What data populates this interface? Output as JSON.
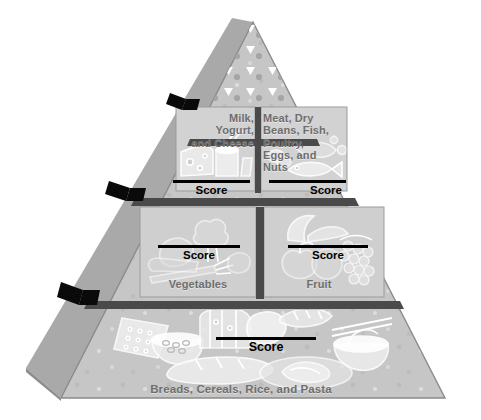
{
  "figure": {
    "background_color": "#ffffff",
    "face_color": "#c6c6c6",
    "side_face_color": "#a9a9a9",
    "panel_color": "#cfcfcf",
    "divider_color": "#3c3c3c",
    "tick_color": "#111111",
    "label_color": "#6e6e6e",
    "score_color": "#000000",
    "art_color": "#ffffff"
  },
  "apex": {
    "name": "fats-oils-and-sweets-tier",
    "symbol_triangle": "▽",
    "symbol_circle": "●",
    "triangle_count": 22,
    "circle_count": 17
  },
  "tiers": [
    {
      "id": "tier-apex",
      "level": 1,
      "panels": []
    },
    {
      "id": "tier-upper",
      "level": 2,
      "panels": [
        {
          "id": "milk-yogurt-cheese",
          "label": "Milk,\nYogurt,\nand Cheese",
          "label_lines": [
            "Milk,",
            "Yogurt,",
            "and Cheese"
          ],
          "score_label": "Score",
          "score_value": ""
        },
        {
          "id": "meat-beans-fish-poultry-eggs-nuts",
          "label": "Meat, Dry Beans, Fish, Poultry, Eggs, and Nuts",
          "label_lines": [
            "Meat, Dry",
            "Beans, Fish,",
            "Poultry,",
            "Eggs, and",
            "Nuts"
          ],
          "score_label": "Score",
          "score_value": ""
        }
      ]
    },
    {
      "id": "tier-middle",
      "level": 3,
      "panels": [
        {
          "id": "vegetables",
          "label": "Vegetables",
          "label_lines": [
            "Vegetables"
          ],
          "score_label": "Score",
          "score_value": ""
        },
        {
          "id": "fruit",
          "label": "Fruit",
          "label_lines": [
            "Fruit"
          ],
          "score_label": "Score",
          "score_value": ""
        }
      ]
    },
    {
      "id": "tier-base",
      "level": 4,
      "panels": [
        {
          "id": "breads-cereals-rice-pasta",
          "label": "Breads, Cereals, Rice, and Pasta",
          "label_lines": [
            "Breads, Cereals, Rice, and Pasta"
          ],
          "score_label": "Score",
          "score_value": ""
        }
      ]
    }
  ],
  "labels": {
    "milk_line1": "Milk,",
    "milk_line2": "Yogurt,",
    "milk_line3": "and Cheese",
    "meat_line1": "Meat, Dry",
    "meat_line2": "Beans, Fish,",
    "meat_line3": "Poultry,",
    "meat_line4": "Eggs, and",
    "meat_line5": "Nuts",
    "vegetables": "Vegetables",
    "fruit": "Fruit",
    "breads": "Breads, Cereals, Rice, and Pasta"
  },
  "scores": {
    "milk": "Score",
    "meat": "Score",
    "vegetables": "Score",
    "fruit": "Score",
    "breads": "Score"
  }
}
